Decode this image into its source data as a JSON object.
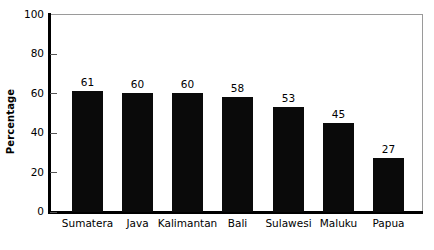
{
  "chart_data": {
    "type": "bar",
    "title": "",
    "subtitle": "",
    "xlabel": "",
    "ylabel": "Percentage",
    "categories": [
      "Sumatera",
      "Java",
      "Kalimantan",
      "Bali",
      "Sulawesi",
      "Maluku",
      "Papua"
    ],
    "values": [
      61,
      60,
      60,
      58,
      53,
      45,
      27
    ],
    "value_labels": [
      "61",
      "60",
      "60",
      "58",
      "53",
      "45",
      "27"
    ],
    "ylim": [
      0,
      100
    ],
    "yticks": [
      0,
      20,
      40,
      60,
      80,
      100
    ],
    "ytick_labels": [
      "0",
      "20",
      "40",
      "60",
      "80",
      "100"
    ],
    "grid": false,
    "legend": false,
    "legend_position": "none",
    "bar_color": "#0a0a0a",
    "axis_color": "#000000",
    "frame_color": "#9a9a9a",
    "background": "#ffffff"
  }
}
